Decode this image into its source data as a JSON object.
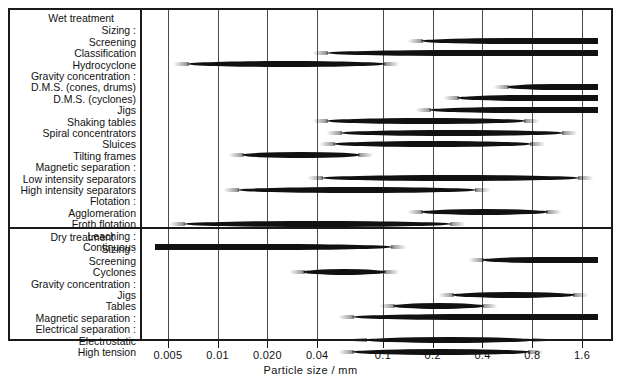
{
  "chart_data": {
    "type": "bar",
    "title": "",
    "xlabel": "Particle size / mm",
    "ylabel": "",
    "scale": "log",
    "grid": true,
    "legend": null,
    "xticks": [
      "0.005",
      "0.01",
      "0.020",
      "0.04",
      "0.1",
      "0.2",
      "0.4",
      "0.8",
      "1.6"
    ],
    "xtick_values": [
      0.005,
      0.01,
      0.02,
      0.04,
      0.1,
      0.2,
      0.4,
      0.8,
      1.6
    ],
    "sections": [
      {
        "name": "Wet treatment",
        "groups": [
          {
            "heading": "Sizing :",
            "rows": [
              {
                "label": "Screening",
                "min": 0.17,
                "max": 2.0,
                "open_max": true
              },
              {
                "label": "Classification",
                "min": 0.045,
                "max": 2.0,
                "open_max": true
              },
              {
                "label": "Hydrocyclone",
                "min": 0.0065,
                "max": 0.105
              }
            ]
          },
          {
            "heading": "Gravity concentration :",
            "rows": [
              {
                "label": "D.M.S. (cones, drums)",
                "min": 0.56,
                "max": 2.0,
                "open_max": true
              },
              {
                "label": "D.M.S. (cyclones)",
                "min": 0.28,
                "max": 2.0,
                "open_max": true
              },
              {
                "label": "Jigs",
                "min": 0.19,
                "max": 2.0,
                "open_max": true
              },
              {
                "label": "Shaking tables",
                "min": 0.045,
                "max": 0.73
              },
              {
                "label": "Spiral concentrators",
                "min": 0.055,
                "max": 1.25
              },
              {
                "label": "Sluices",
                "min": 0.05,
                "max": 0.8
              },
              {
                "label": "Tilting frames",
                "min": 0.014,
                "max": 0.073
              }
            ]
          },
          {
            "heading": "Magnetic separation :",
            "rows": [
              {
                "label": "Low intensity separators",
                "min": 0.042,
                "max": 1.55
              },
              {
                "label": "High intensity separators",
                "min": 0.013,
                "max": 0.37
              }
            ]
          },
          {
            "heading": "Flotation :",
            "rows": [
              {
                "label": "Agglomeration",
                "min": 0.17,
                "max": 1.0
              },
              {
                "label": "Froth flotation",
                "min": 0.0062,
                "max": 0.26
              }
            ]
          },
          {
            "heading": "Leaching :",
            "rows": [
              {
                "label": "Continuous",
                "min": 0.0042,
                "max": 0.115,
                "open_min": true
              }
            ]
          }
        ]
      },
      {
        "name": "Dry treatment",
        "groups": [
          {
            "heading": "Sizing :",
            "rows": [
              {
                "label": "Screening",
                "min": 0.4,
                "max": 2.0,
                "open_max": true
              },
              {
                "label": "Cyclones",
                "min": 0.033,
                "max": 0.105
              }
            ]
          },
          {
            "heading": "Gravity concentration :",
            "rows": [
              {
                "label": "Jigs",
                "min": 0.26,
                "max": 1.45
              },
              {
                "label": "Tables",
                "min": 0.115,
                "max": 0.41
              }
            ]
          },
          {
            "heading": "Magnetic separation :",
            "rows": [
              {
                "label": "",
                "min": 0.065,
                "max": 2.0,
                "open_max": true
              }
            ]
          },
          {
            "heading": "Electrical separation :",
            "rows": [
              {
                "label": "Electrostatic",
                "min": 0.078,
                "max": 0.82
              },
              {
                "label": "High tension",
                "min": 0.065,
                "max": 0.78
              }
            ]
          }
        ]
      }
    ]
  },
  "labels": {
    "wet_treatment": "Wet treatment",
    "dry_treatment": "Dry treatment",
    "sizing": "Sizing :",
    "gravity_concentration": "Gravity concentration :",
    "magnetic_separation": "Magnetic separation :",
    "flotation": "Flotation :",
    "leaching": "Leaching :",
    "electrical_separation": "Electrical separation :",
    "screening": "Screening",
    "classification": "Classification",
    "hydrocyclone": "Hydrocyclone",
    "dms_cones_drums": "D.M.S. (cones, drums)",
    "dms_cyclones": "D.M.S. (cyclones)",
    "jigs": "Jigs",
    "shaking_tables": "Shaking tables",
    "spiral_concentrators": "Spiral concentrators",
    "sluices": "Sluices",
    "tilting_frames": "Tilting frames",
    "low_intensity_separators": "Low intensity separators",
    "high_intensity_separators": "High intensity separators",
    "agglomeration": "Agglomeration",
    "froth_flotation": "Froth flotation",
    "continuous": "Continuous",
    "cyclones": "Cyclones",
    "tables": "Tables",
    "electrostatic": "Electrostatic",
    "high_tension": "High tension"
  },
  "colors": {
    "bar": "#111111",
    "grid": "#4a4a4a",
    "frame": "#1a1a1a",
    "background": "#ffffff"
  }
}
